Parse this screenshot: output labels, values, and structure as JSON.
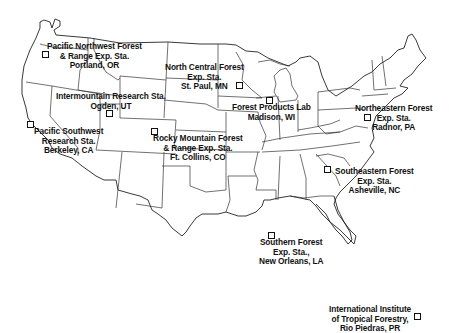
{
  "map": {
    "title": "Forest Service Research Stations and Laboratories",
    "stations": [
      {
        "id": "pnw",
        "lines": [
          "Pacific Northwest Forest",
          "& Range Exp. Sta.",
          "Portland, OR"
        ]
      },
      {
        "id": "nc",
        "lines": [
          "North Central Forest",
          "Exp. Sta.",
          "St. Paul, MN"
        ]
      },
      {
        "id": "int",
        "lines": [
          "Intermountain Research Sta.",
          "Ogden, UT"
        ]
      },
      {
        "id": "fpl",
        "lines": [
          "Forest Products Lab",
          "Madison, WI"
        ]
      },
      {
        "id": "ne",
        "lines": [
          "Northeastern Forest",
          "Exp. Sta.",
          "Radnor, PA"
        ]
      },
      {
        "id": "psw",
        "lines": [
          "Pacific Southwest",
          "Research Sta.",
          "Berkeley, CA"
        ]
      },
      {
        "id": "rm",
        "lines": [
          "Rocky Mountain Forest",
          "& Range Exp. Sta.",
          "Ft. Collins, CO"
        ]
      },
      {
        "id": "se",
        "lines": [
          "Southeastern Forest",
          "Exp. Sta.",
          "Asheville, NC"
        ]
      },
      {
        "id": "so",
        "lines": [
          "Southern Forest",
          "Exp. Sta.,",
          "New Orleans, LA"
        ]
      },
      {
        "id": "iitf",
        "lines": [
          "International Institute",
          "of Tropical Forestry,",
          "Rio Piedras, PR"
        ]
      }
    ],
    "colors": {
      "line": "#333333",
      "background": "#ffffff",
      "text": "#111111"
    }
  }
}
